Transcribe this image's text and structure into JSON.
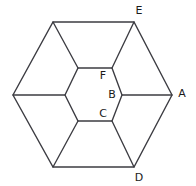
{
  "figure": {
    "background_color": "#ffffff",
    "line_color": "#3c3c42",
    "label_color": "#1a1a1a",
    "outer_hexagon": {
      "name": "outer-hexagon",
      "points": [
        {
          "id": "out-top-left",
          "x": 53,
          "y": 22
        },
        {
          "id": "out-top-right",
          "x": 134,
          "y": 22
        },
        {
          "id": "out-right",
          "x": 172,
          "y": 95
        },
        {
          "id": "out-bottom-right",
          "x": 134,
          "y": 167
        },
        {
          "id": "out-bottom-left",
          "x": 53,
          "y": 167
        },
        {
          "id": "out-left",
          "x": 13,
          "y": 95
        }
      ],
      "path": "53,22 134,22 172,95 134,167 53,167 13,95"
    },
    "inner_hexagon": {
      "name": "inner-hexagon",
      "points": [
        {
          "id": "in-top-left",
          "x": 78,
          "y": 68
        },
        {
          "id": "in-top-right",
          "x": 112,
          "y": 68
        },
        {
          "id": "in-right",
          "x": 122,
          "y": 95
        },
        {
          "id": "in-bottom-right",
          "x": 112,
          "y": 121
        },
        {
          "id": "in-bottom-left",
          "x": 78,
          "y": 121
        },
        {
          "id": "in-left",
          "x": 65,
          "y": 95
        }
      ],
      "path": "78,68 112,68 122,95 112,121 78,121 65,95"
    },
    "spokes": [
      {
        "id": "spoke-top-left",
        "x1": 78,
        "y1": 68,
        "x2": 53,
        "y2": 22
      },
      {
        "id": "spoke-top-right",
        "x1": 112,
        "y1": 68,
        "x2": 134,
        "y2": 22
      },
      {
        "id": "spoke-right",
        "x1": 122,
        "y1": 95,
        "x2": 172,
        "y2": 95
      },
      {
        "id": "spoke-bottom-right",
        "x1": 112,
        "y1": 121,
        "x2": 134,
        "y2": 167
      },
      {
        "id": "spoke-bottom-left",
        "x1": 78,
        "y1": 121,
        "x2": 53,
        "y2": 167
      },
      {
        "id": "spoke-left",
        "x1": 65,
        "y1": 95,
        "x2": 13,
        "y2": 95
      }
    ],
    "labels": [
      {
        "id": "label-E",
        "text": "E",
        "x": 139,
        "y": 11,
        "anchor": "middle",
        "position": "outside top-right vertex"
      },
      {
        "id": "label-A",
        "text": "A",
        "x": 182,
        "y": 94,
        "anchor": "middle",
        "position": "outside right vertex"
      },
      {
        "id": "label-D",
        "text": "D",
        "x": 139,
        "y": 178,
        "anchor": "middle",
        "position": "outside bottom-right vertex"
      },
      {
        "id": "label-F",
        "text": "F",
        "x": 103,
        "y": 76,
        "anchor": "middle",
        "position": "inside near inner top-right"
      },
      {
        "id": "label-B",
        "text": "B",
        "x": 112,
        "y": 95,
        "anchor": "middle",
        "position": "inside near inner right"
      },
      {
        "id": "label-C",
        "text": "C",
        "x": 103,
        "y": 114,
        "anchor": "middle",
        "position": "inside near inner bottom-right"
      }
    ]
  }
}
